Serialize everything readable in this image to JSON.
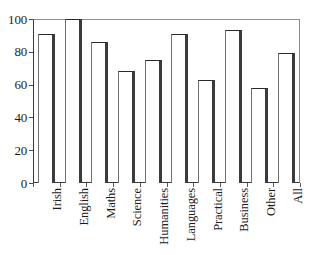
{
  "chart_data": {
    "type": "bar",
    "title": "",
    "subtitle": "",
    "xlabel": "",
    "ylabel": "",
    "ylim": [
      0,
      100
    ],
    "yticks": [
      0,
      20,
      40,
      60,
      80,
      100
    ],
    "ytick_labels": [
      "0",
      "20",
      "40",
      "60",
      "80",
      "100"
    ],
    "grid": false,
    "legend": false,
    "legend_position": "none",
    "orientation": "vertical",
    "bar_style": "white-fill-dark-outline-3d-shadow",
    "categories": [
      "Irish",
      "English",
      "Maths",
      "Science",
      "Humanities",
      "Languages",
      "Practical",
      "Business",
      "Other",
      "All"
    ],
    "values": [
      91,
      100,
      86,
      68,
      75,
      91,
      63,
      93,
      58,
      79
    ],
    "series": [
      {
        "name": "",
        "values": [
          91,
          100,
          86,
          68,
          75,
          91,
          63,
          93,
          58,
          79
        ]
      }
    ],
    "annotations": []
  },
  "colors": {
    "background": "#ffffff",
    "bar_fill": "#ffffff",
    "bar_outline": "#2b2b2b",
    "bar_shadow": "#3b3b3b",
    "axis": "#3a3a3a",
    "frame": "#8d8d8d",
    "text": "#1c1c1c"
  }
}
